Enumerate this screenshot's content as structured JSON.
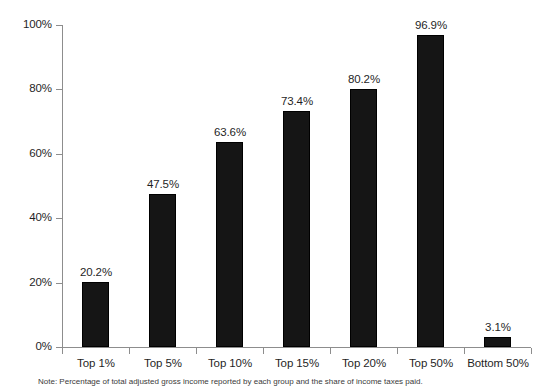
{
  "chart_data": {
    "type": "bar",
    "title": "",
    "subtitle": "",
    "xlabel": "",
    "ylabel": "",
    "categories": [
      "Top 1%",
      "Top 5%",
      "Top 10%",
      "Top 15%",
      "Top 20%",
      "Top 50%",
      "Bottom 50%"
    ],
    "values": [
      20.2,
      47.5,
      63.6,
      73.4,
      80.2,
      96.9,
      3.1
    ],
    "value_labels": [
      "20.2%",
      "47.5%",
      "63.6%",
      "73.4%",
      "80.2%",
      "96.9%",
      "3.1%"
    ],
    "ylim": [
      0,
      100
    ],
    "ytick_values": [
      0,
      20,
      40,
      60,
      80,
      100
    ],
    "ytick_labels": [
      "0%",
      "20%",
      "40%",
      "60%",
      "80%",
      "100%"
    ],
    "grid": false,
    "legend": null,
    "legend_position": "none",
    "bar_color": "#151515",
    "axis_color": "#8d8d8d",
    "text_color": "#1f1f1f",
    "annotations": []
  },
  "footnote": {
    "text": "Note: Percentage of total adjusted gross income reported by each group and the share of income taxes paid."
  }
}
